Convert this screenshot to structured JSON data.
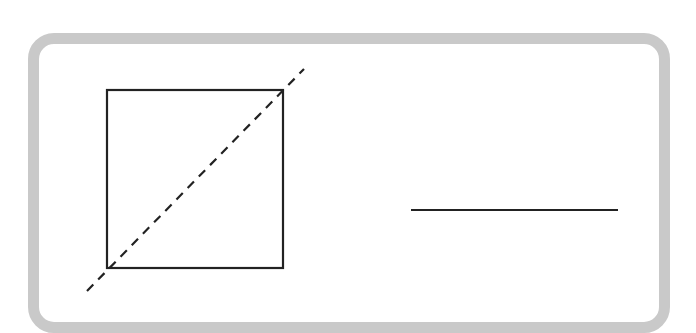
{
  "diagram": {
    "colors": {
      "border": "#c9c9c9",
      "stroke": "#222222",
      "background": "#ffffff"
    },
    "square": {
      "x": 107,
      "y": 90,
      "width": 176,
      "height": 178
    },
    "diagonal": {
      "x1": 87,
      "y1": 291,
      "x2": 304,
      "y2": 69,
      "style": "dashed"
    },
    "segment": {
      "x1": 411,
      "y1": 210,
      "x2": 618,
      "y2": 210
    }
  }
}
